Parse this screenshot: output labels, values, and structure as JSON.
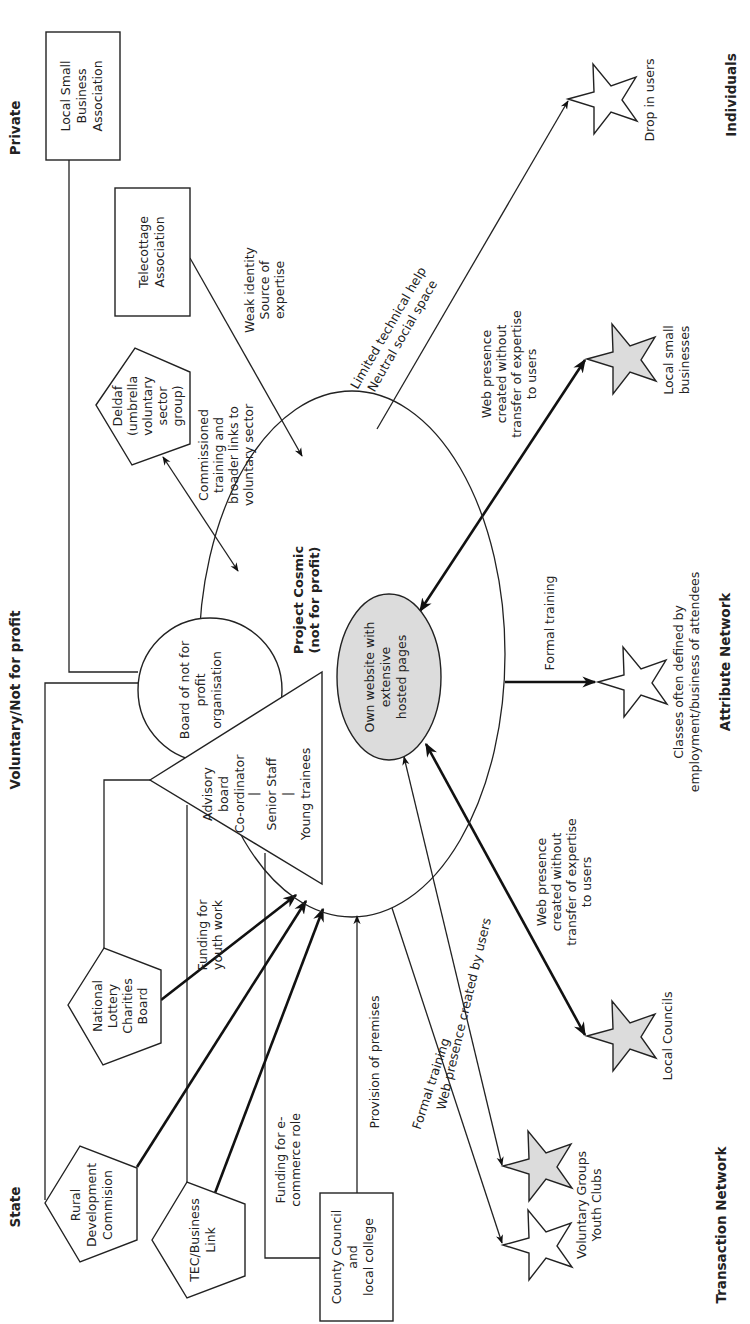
{
  "diagram": {
    "orientation": "rotated-90-ccw",
    "sectors": {
      "private": "Private",
      "voluntary": "Voluntary/Not for profit",
      "state": "State"
    },
    "networks": {
      "individuals": "Individuals",
      "attribute": "Attribute Network",
      "transaction": "Transaction Network"
    },
    "center": {
      "title_line1": "Project Cosmic",
      "title_line2": "(not for profit)",
      "website_line1": "Own website with",
      "website_line2": "extensive",
      "website_line3": "hosted pages"
    },
    "board": {
      "line1": "Board of not for",
      "line2": "profit",
      "line3": "organisation"
    },
    "staff_triangle": {
      "line1": "Advisory",
      "line2": "board",
      "line3": "Co-ordinator",
      "sep1": "|",
      "line4": "Senior Staff",
      "sep2": "|",
      "line5": "Young trainees"
    },
    "nodes": {
      "local_small_business_assoc": {
        "line1": "Local Small",
        "line2": "Business",
        "line3": "Association",
        "shape": "rectangle"
      },
      "telecottage": {
        "line1": "Telecottage",
        "line2": "Association",
        "shape": "rectangle"
      },
      "deldaf": {
        "line1": "Deldaf",
        "line2": "(umbrella",
        "line3": "voluntary",
        "line4": "sector",
        "line5": "group)",
        "shape": "pentagon"
      },
      "national_lottery": {
        "line1": "National",
        "line2": "Lottery",
        "line3": "Charities",
        "line4": "Board",
        "shape": "pentagon"
      },
      "rural_development": {
        "line1": "Rural",
        "line2": "Development",
        "line3": "Commision",
        "shape": "pentagon"
      },
      "tec_business_link": {
        "line1": "TEC/Business",
        "line2": "Link",
        "shape": "pentagon"
      },
      "county_council": {
        "line1": "County Council",
        "line2": "and",
        "line3": "local college",
        "shape": "rectangle"
      }
    },
    "users": {
      "drop_in": {
        "label": "Drop in users",
        "fill": "white"
      },
      "local_small_businesses": {
        "line1": "Local small",
        "line2": "businesses",
        "fill": "gray"
      },
      "classes": {
        "line1": "Classes often defined by",
        "line2": "employment/business of attendees",
        "fill": "white"
      },
      "local_councils": {
        "label": "Local Councils",
        "fill": "gray"
      },
      "voluntary_groups": {
        "line1": "Voluntary Groups",
        "line2": "Youth Clubs",
        "fill_top": "gray",
        "fill_bottom": "white"
      }
    },
    "edge_labels": {
      "weak_identity": {
        "line1": "Weak identity",
        "line2": "Source of",
        "line3": "expertise"
      },
      "limited_help": {
        "line1": "Limited technical help",
        "line2": "Neutral social space"
      },
      "commissioned": {
        "line1": "Commissioned",
        "line2": "training and",
        "line3": "broader links to",
        "line4": "voluntary sector"
      },
      "web_presence_lsb": {
        "line1": "Web presence",
        "line2": "created without",
        "line3": "transfer of expertise",
        "line4": "to users"
      },
      "formal_training_classes": "Formal training",
      "web_presence_councils": {
        "line1": "Web presence",
        "line2": "created without",
        "line3": "transfer of expertise",
        "line4": "to users"
      },
      "web_presence_users": "Web presence created by users",
      "formal_training_vg": "Formal training",
      "funding_youth": {
        "line1": "Funding for",
        "line2": "youth work"
      },
      "funding_ecommerce": {
        "line1": "Funding for e-",
        "line2": "commerce role"
      },
      "provision_premises": "Provision of premises"
    },
    "colors": {
      "stroke": "#222222",
      "gray_fill": "#dcdcdc",
      "background": "#ffffff"
    }
  }
}
